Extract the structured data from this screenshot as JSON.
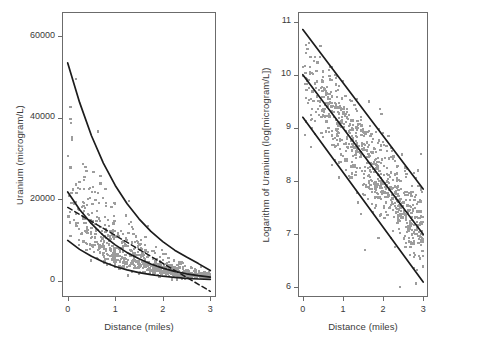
{
  "figure": {
    "background": "#ffffff",
    "point_color": "#9d9d9d",
    "line_color": "#1c1c1c",
    "frame_color": "#6b6b6b",
    "text_color": "#3a3a3a"
  },
  "chart_data": [
    {
      "panel": "left",
      "type": "scatter",
      "title": "",
      "xlabel": "Distance (miles)",
      "ylabel": "Uranium (microgram/L)",
      "xlim": [
        -0.12,
        3.12
      ],
      "ylim": [
        -4000,
        66000
      ],
      "xticks": [
        0,
        1,
        2,
        3
      ],
      "xticklabels": [
        "0",
        "1",
        "2",
        "3"
      ],
      "yticks": [
        0,
        20000,
        40000,
        60000
      ],
      "yticklabels": [
        "0",
        "20000",
        "40000",
        "60000"
      ],
      "grid": false,
      "legend": "none",
      "n_points": 760,
      "annotations": [
        "Three solid exponential decay curves (upper, middle, lower envelope of fitted quantiles)",
        "One dashed straight line descending from about 18000 at 0 miles to below 0 near 3 miles"
      ],
      "series": [
        {
          "name": "upper-exponential-curve",
          "style": "solid",
          "model": "exponential-decay",
          "y0": 53500,
          "y_at_3": 2500,
          "x": [
            0,
            0.25,
            0.5,
            0.75,
            1.0,
            1.25,
            1.5,
            1.75,
            2.0,
            2.25,
            2.5,
            2.75,
            3.0
          ],
          "values": [
            53500,
            43800,
            35600,
            28900,
            23400,
            18900,
            15200,
            12100,
            9600,
            7500,
            5800,
            4200,
            2500
          ]
        },
        {
          "name": "middle-exponential-curve",
          "style": "solid",
          "model": "exponential-decay",
          "y0": 21800,
          "y_at_3": 900,
          "x": [
            0,
            0.25,
            0.5,
            0.75,
            1.0,
            1.25,
            1.5,
            1.75,
            2.0,
            2.25,
            2.5,
            2.75,
            3.0
          ],
          "values": [
            21800,
            17500,
            14000,
            11100,
            8800,
            6900,
            5400,
            4100,
            3100,
            2300,
            1700,
            1250,
            900
          ]
        },
        {
          "name": "lower-exponential-curve",
          "style": "solid",
          "model": "exponential-decay",
          "y0": 9900,
          "y_at_3": 300,
          "x": [
            0,
            0.25,
            0.5,
            0.75,
            1.0,
            1.25,
            1.5,
            1.75,
            2.0,
            2.25,
            2.5,
            2.75,
            3.0
          ],
          "values": [
            9900,
            7700,
            6000,
            4600,
            3500,
            2650,
            2000,
            1500,
            1100,
            800,
            580,
            420,
            300
          ]
        },
        {
          "name": "dashed-linear-fit",
          "style": "dashed",
          "model": "linear",
          "x": [
            0,
            3
          ],
          "values": [
            18000,
            -2600
          ]
        }
      ]
    },
    {
      "panel": "right",
      "type": "scatter",
      "title": "",
      "xlabel": "Distance (miles)",
      "ylabel": "Logarithm of Uranium (log[microgram/L])",
      "xlim": [
        -0.12,
        3.12
      ],
      "ylim": [
        5.82,
        11.18
      ],
      "xticks": [
        0,
        1,
        2,
        3
      ],
      "xticklabels": [
        "0",
        "1",
        "2",
        "3"
      ],
      "yticks": [
        6,
        7,
        8,
        9,
        10,
        11
      ],
      "yticklabels": [
        "6",
        "7",
        "8",
        "9",
        "10",
        "11"
      ],
      "grid": false,
      "legend": "none",
      "n_points": 760,
      "annotations": [
        "Three parallel straight regression lines: fitted mean with upper and lower prediction bounds"
      ],
      "series": [
        {
          "name": "upper-regression-line",
          "style": "solid",
          "model": "linear",
          "x": [
            0,
            3
          ],
          "values": [
            10.85,
            7.85
          ]
        },
        {
          "name": "mean-regression-line",
          "style": "solid",
          "model": "linear",
          "x": [
            0,
            3
          ],
          "values": [
            10.0,
            7.0
          ]
        },
        {
          "name": "lower-regression-line",
          "style": "solid",
          "model": "linear",
          "x": [
            0,
            3
          ],
          "values": [
            9.2,
            6.1
          ]
        }
      ]
    }
  ]
}
